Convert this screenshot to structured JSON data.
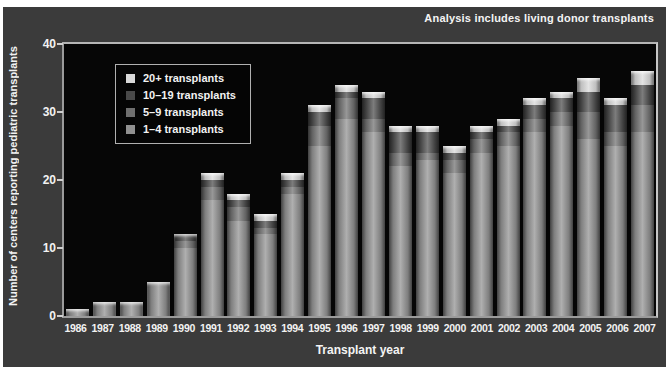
{
  "figure": {
    "note": "Analysis includes living donor transplants",
    "background_color": "#3b3b3b",
    "plot_background_color": "#060606",
    "text_color": "#f2f2f2"
  },
  "chart_data": {
    "type": "bar",
    "stacked": true,
    "title": "",
    "note": "Analysis includes living donor transplants",
    "xlabel": "Transplant year",
    "ylabel": "Number of centers reporting pediatric transplants",
    "ylim": [
      0,
      40
    ],
    "yticks": [
      0,
      10,
      20,
      30,
      40
    ],
    "grid": false,
    "legend_position": "upper-left-inside",
    "categories": [
      "1986",
      "1987",
      "1988",
      "1989",
      "1990",
      "1991",
      "1992",
      "1993",
      "1994",
      "1995",
      "1996",
      "1997",
      "1998",
      "1999",
      "2000",
      "2001",
      "2002",
      "2003",
      "2004",
      "2005",
      "2006",
      "2007"
    ],
    "series": [
      {
        "name": "1–4 transplants",
        "color": "#909090",
        "values": [
          1,
          2,
          2,
          5,
          10,
          17,
          14,
          12,
          18,
          25,
          29,
          27,
          22,
          23,
          21,
          24,
          25,
          27,
          28,
          26,
          25,
          27
        ]
      },
      {
        "name": "5–9 transplants",
        "color": "#6f6f6f",
        "values": [
          0,
          0,
          0,
          0,
          1,
          2,
          2,
          1,
          1,
          3,
          3,
          2,
          2,
          1,
          2,
          2,
          2,
          2,
          2,
          4,
          2,
          4
        ]
      },
      {
        "name": "10–19 transplants",
        "color": "#4a4a4a",
        "values": [
          0,
          0,
          0,
          0,
          1,
          1,
          1,
          1,
          1,
          2,
          1,
          3,
          3,
          3,
          1,
          1,
          1,
          2,
          2,
          3,
          4,
          3
        ]
      },
      {
        "name": "20+ transplants",
        "color": "#d9d9d9",
        "values": [
          0,
          0,
          0,
          0,
          0,
          1,
          1,
          1,
          1,
          1,
          1,
          1,
          1,
          1,
          1,
          1,
          1,
          1,
          1,
          2,
          1,
          2
        ]
      }
    ],
    "legend": [
      {
        "label": "20+ transplants",
        "color": "#d9d9d9"
      },
      {
        "label": "10–19 transplants",
        "color": "#4a4a4a"
      },
      {
        "label": "5–9 transplants",
        "color": "#6f6f6f"
      },
      {
        "label": "1–4 transplants",
        "color": "#909090"
      }
    ],
    "totals": [
      1,
      2,
      2,
      5,
      12,
      21,
      18,
      15,
      21,
      31,
      34,
      33,
      28,
      28,
      25,
      28,
      29,
      32,
      33,
      35,
      32,
      36
    ]
  }
}
